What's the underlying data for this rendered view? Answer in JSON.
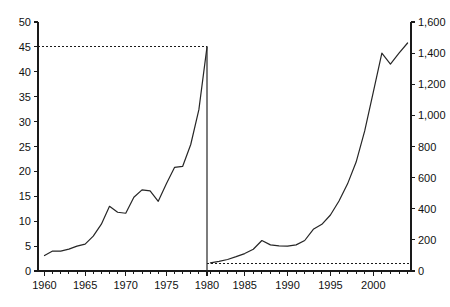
{
  "chart_data": {
    "type": "line",
    "title": "",
    "subtitle": "",
    "xlabel": "",
    "grid": false,
    "legend_position": "none",
    "panels": [
      {
        "name": "left-panel",
        "ylabel": "",
        "ylim": [
          0,
          50
        ],
        "ytick_values": [
          0,
          5,
          10,
          15,
          20,
          25,
          30,
          35,
          40,
          45,
          50
        ],
        "ytick_labels": [
          "0",
          "5",
          "10",
          "15",
          "20",
          "25",
          "30",
          "35",
          "40",
          "45",
          "50"
        ],
        "xlim": [
          1959.2,
          1980.0
        ],
        "xtick_labels": [
          "1960",
          "1965",
          "1970",
          "1975",
          "1980"
        ],
        "xtick_values": [
          1960,
          1965,
          1970,
          1975,
          1980
        ],
        "reference_line": {
          "value": 45,
          "style": "dashed",
          "x_start": 1959.2,
          "x_end": 1980.0
        },
        "series": [
          {
            "name": "left-series",
            "x": [
              1960,
              1961,
              1962,
              1963,
              1964,
              1965,
              1966,
              1967,
              1968,
              1969,
              1970,
              1971,
              1972,
              1973,
              1974,
              1975,
              1976,
              1977,
              1978,
              1979,
              1980
            ],
            "values": [
              3.1,
              4.0,
              4.0,
              4.4,
              5.0,
              5.4,
              7.0,
              9.4,
              13.0,
              11.8,
              11.6,
              14.8,
              16.3,
              16.1,
              14.0,
              17.5,
              20.8,
              21.0,
              25.4,
              32.4,
              45.0
            ]
          }
        ]
      },
      {
        "name": "right-panel",
        "ylabel": "",
        "ylim": [
          0,
          1600
        ],
        "ytick_values": [
          0,
          200,
          400,
          600,
          800,
          1000,
          1200,
          1400,
          1600
        ],
        "ytick_labels": [
          "0",
          "200",
          "400",
          "600",
          "800",
          "1,000",
          "1,200",
          "1,400",
          "1,600"
        ],
        "xlim": [
          1980.6,
          2004.4
        ],
        "xtick_labels": [
          "1985",
          "1990",
          "1995",
          "2000"
        ],
        "xtick_values": [
          1985,
          1990,
          1995,
          2000
        ],
        "reference_line": {
          "value": 45,
          "style": "dashed",
          "x_start": 1980.6,
          "x_end": 2004.4
        },
        "series": [
          {
            "name": "right-series",
            "x": [
              1981,
              1982,
              1983,
              1984,
              1985,
              1986,
              1987,
              1988,
              1989,
              1990,
              1991,
              1992,
              1993,
              1994,
              1995,
              1996,
              1997,
              1998,
              1999,
              2000,
              2001,
              2002,
              2003,
              2004
            ],
            "values": [
              52,
              62,
              74,
              92,
              112,
              140,
              196,
              168,
              162,
              160,
              168,
              196,
              268,
              300,
              360,
              450,
              560,
              700,
              900,
              1150,
              1400,
              1330,
              1400,
              1465
            ]
          }
        ]
      }
    ]
  }
}
